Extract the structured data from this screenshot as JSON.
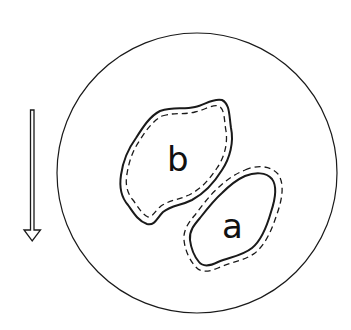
{
  "diagram": {
    "labels": {
      "b": "b",
      "a": "a"
    },
    "colors": {
      "stroke": "#1a1a1a",
      "background": "#ffffff"
    },
    "elements": [
      {
        "id": "field-circle",
        "type": "circle",
        "description": "large enclosing circle"
      },
      {
        "id": "arrow",
        "type": "arrow",
        "direction": "down",
        "style": "hollow outline"
      },
      {
        "id": "region-b",
        "label": "b",
        "outline": "solid outer, dashed inner"
      },
      {
        "id": "region-a",
        "label": "a",
        "outline": "solid inner, dashed outer"
      }
    ]
  }
}
